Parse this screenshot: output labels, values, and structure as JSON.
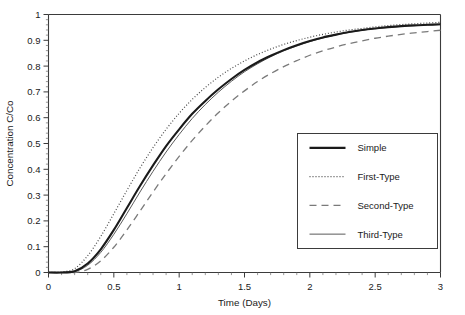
{
  "chart_data": {
    "type": "line",
    "title": "",
    "xlabel": "Time (Days)",
    "ylabel": "Concentration C/Co",
    "xlim": [
      0,
      3
    ],
    "ylim": [
      0,
      1
    ],
    "grid": false,
    "legend_position": "lower-right-inside",
    "x_ticks": [
      "0",
      "0.5",
      "1",
      "1.5",
      "2",
      "2.5",
      "3"
    ],
    "x_tick_values": [
      0,
      0.5,
      1,
      1.5,
      2,
      2.5,
      3
    ],
    "x_minor_step": 0.1,
    "y_ticks": [
      "0",
      "0.1",
      "0.2",
      "0.3",
      "0.4",
      "0.5",
      "0.6",
      "0.7",
      "0.8",
      "0.9",
      "1"
    ],
    "y_tick_values": [
      0,
      0.1,
      0.2,
      0.3,
      0.4,
      0.5,
      0.6,
      0.7,
      0.8,
      0.9,
      1
    ],
    "y_minor_step": 0.02,
    "x": [
      0,
      0.1,
      0.2,
      0.3,
      0.4,
      0.5,
      0.6,
      0.7,
      0.8,
      0.9,
      1.0,
      1.1,
      1.2,
      1.3,
      1.4,
      1.5,
      1.6,
      1.7,
      1.8,
      1.9,
      2.0,
      2.1,
      2.2,
      2.3,
      2.4,
      2.5,
      2.6,
      2.7,
      2.8,
      2.9,
      3.0
    ],
    "series": [
      {
        "name": "Simple",
        "style": "solid-thick",
        "color": "#1a1a1a",
        "width": 2.1,
        "dash": "none",
        "values": [
          0,
          0.0,
          0.005,
          0.035,
          0.09,
          0.165,
          0.25,
          0.335,
          0.415,
          0.49,
          0.555,
          0.615,
          0.665,
          0.71,
          0.75,
          0.785,
          0.815,
          0.84,
          0.862,
          0.881,
          0.897,
          0.911,
          0.922,
          0.932,
          0.94,
          0.946,
          0.951,
          0.955,
          0.958,
          0.96,
          0.962
        ]
      },
      {
        "name": "First-Type",
        "style": "dotted",
        "color": "#4a4a4a",
        "width": 1.2,
        "dash": "1,2",
        "values": [
          0,
          0.002,
          0.015,
          0.065,
          0.14,
          0.228,
          0.318,
          0.405,
          0.484,
          0.555,
          0.617,
          0.671,
          0.717,
          0.757,
          0.791,
          0.82,
          0.845,
          0.866,
          0.884,
          0.899,
          0.912,
          0.923,
          0.932,
          0.94,
          0.946,
          0.952,
          0.957,
          0.961,
          0.964,
          0.967,
          0.97
        ]
      },
      {
        "name": "Second-Type",
        "style": "dashed",
        "color": "#7a7a7a",
        "width": 1.3,
        "dash": "7,5",
        "values": [
          0,
          0.0,
          0.0,
          0.012,
          0.045,
          0.098,
          0.165,
          0.238,
          0.312,
          0.383,
          0.45,
          0.512,
          0.568,
          0.619,
          0.664,
          0.704,
          0.74,
          0.771,
          0.798,
          0.821,
          0.842,
          0.859,
          0.874,
          0.887,
          0.898,
          0.908,
          0.916,
          0.923,
          0.929,
          0.934,
          0.939
        ]
      },
      {
        "name": "Third-Type",
        "style": "solid-thin",
        "color": "#5a5a5a",
        "width": 1.0,
        "dash": "none",
        "values": [
          0,
          0.0,
          0.003,
          0.028,
          0.078,
          0.148,
          0.228,
          0.312,
          0.392,
          0.467,
          0.535,
          0.597,
          0.651,
          0.699,
          0.741,
          0.778,
          0.809,
          0.836,
          0.859,
          0.878,
          0.895,
          0.909,
          0.921,
          0.931,
          0.939,
          0.945,
          0.95,
          0.954,
          0.957,
          0.959,
          0.961
        ]
      }
    ]
  },
  "legend": {
    "entries": [
      {
        "label": "Simple"
      },
      {
        "label": "First-Type"
      },
      {
        "label": "Second-Type"
      },
      {
        "label": "Third-Type"
      }
    ]
  },
  "colors": {
    "axis": "#3b3b3b",
    "text": "#1a1a1a",
    "background": "#ffffff"
  }
}
